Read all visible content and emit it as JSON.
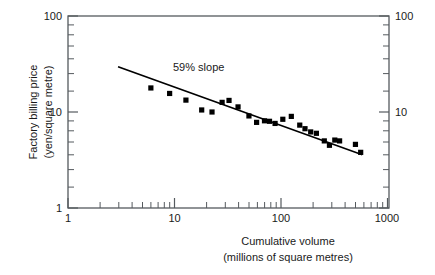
{
  "chart_data": {
    "type": "scatter",
    "title": "",
    "subtitle": "",
    "xlabel": "Cumulative volume",
    "xlabel_sub": "(millions of square metres)",
    "ylabel": "Factory billing price",
    "ylabel_sub": "(yen/square metre)",
    "xscale": "log",
    "yscale": "log",
    "xlim": [
      1,
      1000
    ],
    "ylim": [
      1,
      100
    ],
    "grid": false,
    "legend": null,
    "xticks": [
      1,
      10,
      100,
      1000
    ],
    "xtick_labels": [
      "1",
      "10",
      "100",
      "1000"
    ],
    "yticks": [
      1,
      10,
      100
    ],
    "ytick_labels": [
      "1",
      "10",
      "100"
    ],
    "right_axis_ticks": [
      1,
      10,
      100
    ],
    "right_axis_tick_labels": [
      "",
      "10",
      "100"
    ],
    "minor_ticks": true,
    "annotations": [
      {
        "text": "59% slope",
        "x": 34,
        "y": 26
      }
    ],
    "series": [
      {
        "name": "Factory billing price vs cumulative volume",
        "marker": "square",
        "marker_color": "#000000",
        "points": [
          {
            "x": 6.0,
            "y": 17.8
          },
          {
            "x": 9.0,
            "y": 15.6
          },
          {
            "x": 12.8,
            "y": 13.3
          },
          {
            "x": 18.0,
            "y": 10.5
          },
          {
            "x": 22.5,
            "y": 10.0
          },
          {
            "x": 28.0,
            "y": 12.6
          },
          {
            "x": 32.5,
            "y": 13.2
          },
          {
            "x": 39.5,
            "y": 11.3
          },
          {
            "x": 50.0,
            "y": 9.1
          },
          {
            "x": 59.0,
            "y": 7.8
          },
          {
            "x": 70.0,
            "y": 8.1
          },
          {
            "x": 78.0,
            "y": 8.0
          },
          {
            "x": 88.0,
            "y": 7.6
          },
          {
            "x": 104.0,
            "y": 8.4
          },
          {
            "x": 125.0,
            "y": 9.0
          },
          {
            "x": 150.0,
            "y": 7.3
          },
          {
            "x": 168.0,
            "y": 6.7
          },
          {
            "x": 190.0,
            "y": 6.2
          },
          {
            "x": 215.0,
            "y": 6.0
          },
          {
            "x": 255.0,
            "y": 5.0
          },
          {
            "x": 285.0,
            "y": 4.5
          },
          {
            "x": 320.0,
            "y": 5.1
          },
          {
            "x": 355.0,
            "y": 5.0
          },
          {
            "x": 500.0,
            "y": 4.6
          },
          {
            "x": 560.0,
            "y": 3.8
          }
        ]
      }
    ],
    "trendline": {
      "label": "59% slope",
      "slope_percent": 59,
      "start": {
        "x": 3.0,
        "y": 29.5
      },
      "end": {
        "x": 570.0,
        "y": 3.6
      }
    }
  }
}
